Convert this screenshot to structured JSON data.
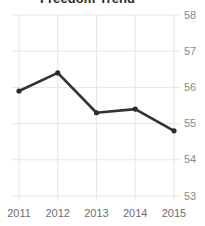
{
  "chart_data": {
    "type": "line",
    "title": "Freedom Trend",
    "xlabel": "",
    "ylabel": "",
    "categories": [
      "2011",
      "2012",
      "2013",
      "2014",
      "2015"
    ],
    "x": [
      2011,
      2012,
      2013,
      2014,
      2015
    ],
    "values": [
      55.9,
      56.4,
      55.3,
      55.4,
      54.8
    ],
    "series": [
      {
        "name": "Freedom Trend",
        "values": [
          55.9,
          56.4,
          55.3,
          55.4,
          54.8
        ]
      }
    ],
    "ylim": [
      53,
      58
    ],
    "xlim": [
      2011,
      2015
    ],
    "yticks": [
      53,
      54,
      55,
      56,
      57,
      58
    ],
    "ytick_labels": [
      "53",
      "54",
      "55",
      "56",
      "57",
      "58"
    ],
    "xticks": [
      2011,
      2012,
      2013,
      2014,
      2015
    ],
    "xtick_labels": [
      "2011",
      "2012",
      "2013",
      "2014",
      "2015"
    ],
    "y_axis_position": "right",
    "grid": true,
    "grid_axis": "both",
    "legend": false,
    "legend_position": "none",
    "marker": "circle",
    "line_color": "#333333",
    "marker_color": "#2b2b2b",
    "grid_color": "#e6e6e6",
    "background_color": "#ffffff",
    "tick_label_color": "#8a8a8a",
    "title_color": "#2b2b2b",
    "title_clipped": true
  }
}
